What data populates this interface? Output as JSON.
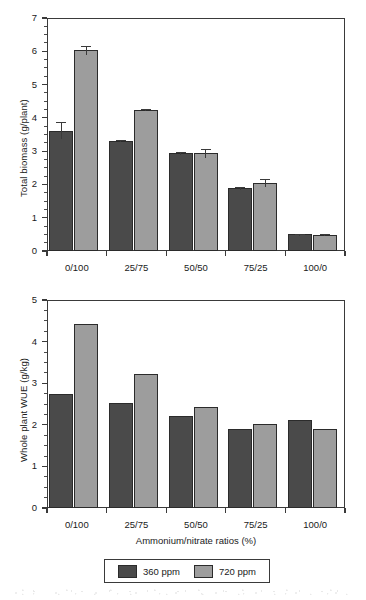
{
  "figure": {
    "background": "#ffffff",
    "colors": {
      "series_360": "#4a4a4a",
      "series_720": "#9d9d9d",
      "axis": "#3a3a3a",
      "text": "#1a1a1a"
    }
  },
  "legend": {
    "items": [
      {
        "label": "360 ppm",
        "color": "#4a4a4a",
        "swatch_name": "legend-swatch-360ppm"
      },
      {
        "label": "720 ppm",
        "color": "#9d9d9d",
        "swatch_name": "legend-swatch-720ppm"
      }
    ]
  },
  "chart_data": [
    {
      "type": "bar",
      "id": "total-biomass",
      "title": "",
      "xlabel": "",
      "ylabel": "Total biomass (g/plant)",
      "categories": [
        "0/100",
        "25/75",
        "50/50",
        "75/25",
        "100/0"
      ],
      "ylim": [
        0,
        7
      ],
      "yticks": [
        0,
        1,
        2,
        3,
        4,
        5,
        6,
        7
      ],
      "ytick_labels": [
        "0",
        "1",
        "2",
        "3",
        "4",
        "5",
        "6",
        "7"
      ],
      "minor_tick_step": 0.25,
      "grid": false,
      "legend_position": "below-figure",
      "series": [
        {
          "name": "360 ppm",
          "color": "#4a4a4a",
          "values": [
            3.62,
            3.3,
            2.93,
            1.88,
            0.5
          ],
          "errors": [
            0.26,
            0.04,
            0.04,
            0.04,
            0.02
          ]
        },
        {
          "name": "720 ppm",
          "color": "#9d9d9d",
          "values": [
            6.03,
            4.25,
            2.93,
            2.04,
            0.49
          ],
          "errors": [
            0.13,
            0.02,
            0.14,
            0.11,
            0.02
          ]
        }
      ]
    },
    {
      "type": "bar",
      "id": "whole-plant-wue",
      "title": "",
      "xlabel": "Ammonium/nitrate ratios (%)",
      "ylabel": "Whole plant WUE (g/kg)",
      "categories": [
        "0/100",
        "25/75",
        "50/50",
        "75/25",
        "100/0"
      ],
      "ylim": [
        0,
        5
      ],
      "yticks": [
        0,
        1,
        2,
        3,
        4,
        5
      ],
      "ytick_labels": [
        "0",
        "1",
        "2",
        "3",
        "4",
        "5"
      ],
      "minor_tick_step": 0.25,
      "grid": false,
      "legend_position": "below-figure",
      "series": [
        {
          "name": "360 ppm",
          "color": "#4a4a4a",
          "values": [
            2.75,
            2.52,
            2.22,
            1.91,
            2.12
          ],
          "errors": [
            0,
            0,
            0,
            0,
            0
          ]
        },
        {
          "name": "720 ppm",
          "color": "#9d9d9d",
          "values": [
            4.42,
            3.22,
            2.42,
            2.01,
            1.91
          ],
          "errors": [
            0,
            0,
            0,
            0,
            0
          ]
        }
      ]
    }
  ]
}
